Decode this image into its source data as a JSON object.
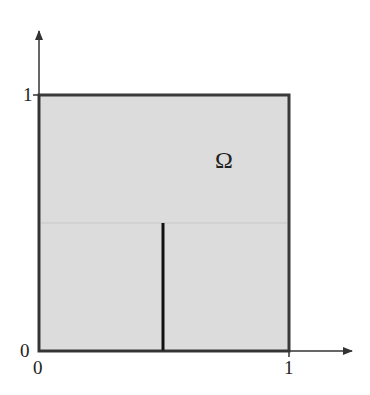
{
  "diagram": {
    "domain_label": "Ω",
    "y_axis": {
      "tick_top": "1",
      "tick_origin": "0"
    },
    "x_axis": {
      "tick_origin": "0",
      "tick_right": "1"
    },
    "colors": {
      "fill": "#dcdcdc",
      "border": "#3a3a3a",
      "axis": "#333333",
      "slit": "#111111",
      "faint_line": "#c8c8c8"
    },
    "slit": {
      "x": 0.5,
      "y_from": 0.0,
      "y_to": 0.5
    }
  }
}
